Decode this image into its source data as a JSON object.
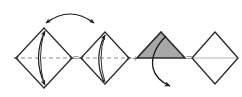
{
  "diagram": {
    "type": "origami-fold-sequence",
    "canvas": {
      "width": 242,
      "height": 97
    },
    "colors": {
      "outline": "#2b2b2b",
      "shaded_fill": "#a8a8a8",
      "shaded_outline": "#2b2b2b",
      "dashed_axis": "#8c8c8c",
      "plain_axis": "#b3b3b3",
      "arrow": "#1a1a1a",
      "operator": "#4a4a4a",
      "background": "#ffffff"
    },
    "operators": [
      {
        "id": "op-1",
        "symbol": "=",
        "name": "equals-sign",
        "x": 76,
        "y": 58
      },
      {
        "id": "op-2",
        "symbol": "+",
        "name": "plus-sign",
        "x": 135,
        "y": 59
      },
      {
        "id": "op-3",
        "symbol": "=",
        "name": "equals-sign",
        "x": 186,
        "y": 58
      }
    ],
    "shapes": [
      {
        "id": "shape-1",
        "name": "diamond-with-fold-arrow",
        "kind": "diamond",
        "center": {
          "x": 44,
          "y": 58
        },
        "half_width": 28,
        "half_height": 30,
        "axis": "dashed",
        "fill": "none",
        "inner_arc": "double-headed",
        "label": "diamond with dashed fold axis and two-way fold arc"
      },
      {
        "id": "shape-2",
        "name": "diamond-with-fold-arrow",
        "kind": "diamond",
        "center": {
          "x": 105,
          "y": 58
        },
        "half_width": 24,
        "half_height": 27,
        "axis": "dashed",
        "fill": "none",
        "inner_arc": "single-headed-up",
        "label": "diamond with dashed fold axis and upward fold arc"
      },
      {
        "id": "shape-3",
        "name": "shaded-folded-triangle",
        "kind": "triangle",
        "center": {
          "x": 161,
          "y": 58
        },
        "half_width": 24,
        "half_height": 27,
        "axis": "none",
        "fill": "shaded",
        "inner_arc": "single-headed-down-external",
        "label": "gray shaded upward triangle with downward unfold arrow"
      },
      {
        "id": "shape-4",
        "name": "plain-diamond",
        "kind": "diamond",
        "center": {
          "x": 214,
          "y": 58
        },
        "half_width": 24,
        "half_height": 27,
        "axis": "plain",
        "fill": "none",
        "inner_arc": "none",
        "label": "plain diamond with light horizontal line"
      }
    ],
    "top_arrow": {
      "name": "top-rotation-arc",
      "description": "double-headed arc above the first two shapes",
      "start": {
        "x": 46,
        "y": 22
      },
      "end": {
        "x": 94,
        "y": 22
      },
      "apex": {
        "x": 70,
        "y": 8
      },
      "heads": "both"
    }
  }
}
